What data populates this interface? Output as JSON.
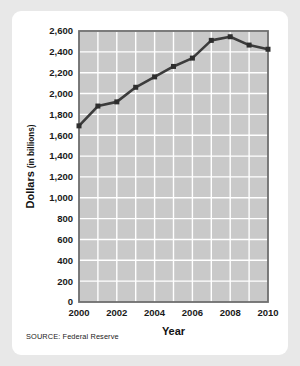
{
  "card": {
    "source_note": "SOURCE: Federal Reserve"
  },
  "chart_data": {
    "type": "line",
    "title": "",
    "xlabel": "Year",
    "ylabel": "Dollars",
    "ylabel_sub": "(in billions)",
    "ylabel_full": "Dollars (in billions)",
    "x": [
      2000,
      2001,
      2002,
      2003,
      2004,
      2005,
      2006,
      2007,
      2008,
      2009,
      2010
    ],
    "values": [
      1690,
      1880,
      1920,
      2060,
      2160,
      2260,
      2340,
      2510,
      2545,
      2465,
      2425
    ],
    "xlim": [
      2000,
      2010
    ],
    "ylim": [
      0,
      2600
    ],
    "y_ticks": [
      0,
      200,
      400,
      600,
      800,
      1000,
      1200,
      1400,
      1600,
      1800,
      2000,
      2200,
      2400,
      2600
    ],
    "y_tick_labels": [
      "0",
      "200",
      "400",
      "600",
      "800",
      "1,000",
      "1,200",
      "1,400",
      "1,600",
      "1,800",
      "2,000",
      "2,200",
      "2,400",
      "2,600"
    ],
    "x_ticks": [
      2000,
      2002,
      2004,
      2006,
      2008,
      2010
    ],
    "x_tick_labels": [
      "2000",
      "2002",
      "2004",
      "2006",
      "2008",
      "2010"
    ],
    "grid": true,
    "legend": false,
    "colors": {
      "plot_background": "#c9c9c9",
      "gridline": "#ffffff",
      "frame": "#6e6e6e",
      "line": "#3c3c3c",
      "marker": "#2e2e2e",
      "page_background": "#e8e8e8",
      "card_background": "#ffffff"
    }
  }
}
